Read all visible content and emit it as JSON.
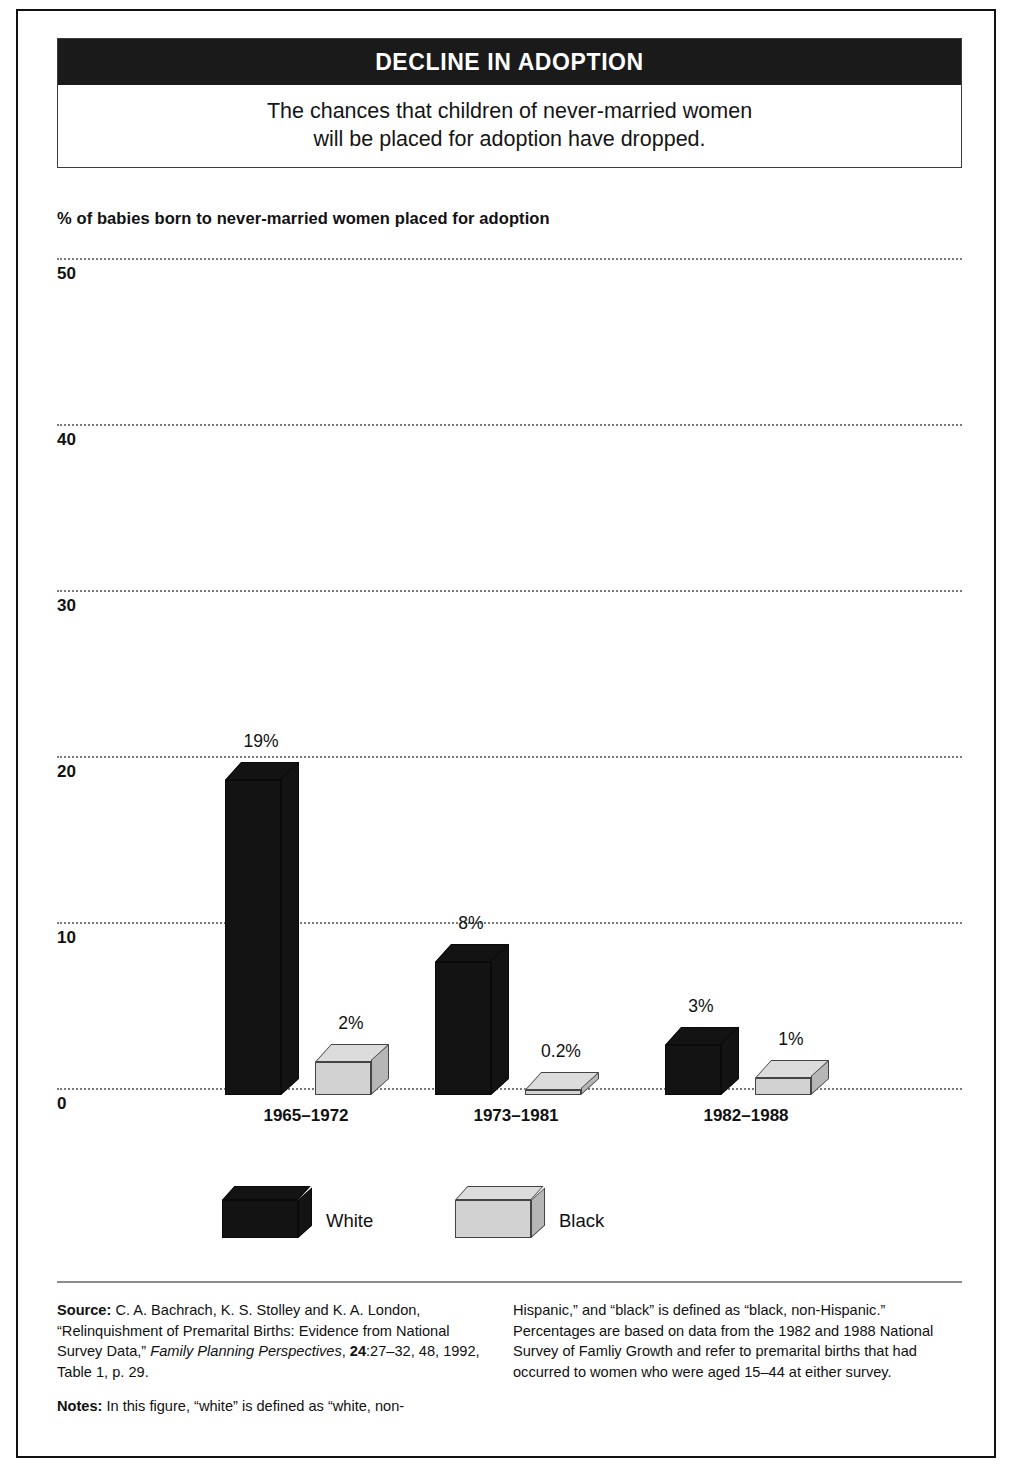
{
  "header": {
    "bar_title": "DECLINE IN ADOPTION",
    "subtitle_line1": "The chances that children of never-married women",
    "subtitle_line2": "will be placed for adoption have dropped."
  },
  "chart_data": {
    "type": "bar",
    "title": "DECLINE IN ADOPTION",
    "subtitle": "The chances that children of never-married women will be placed for adoption have dropped.",
    "ylabel": "% of babies born to never-married women placed for adoption",
    "xlabel": "",
    "categories": [
      "1965–1972",
      "1973–1981",
      "1982–1988"
    ],
    "series": [
      {
        "name": "White",
        "values": [
          19,
          8,
          3
        ],
        "labels": [
          "19%",
          "8%",
          "3%"
        ],
        "color": "#131313"
      },
      {
        "name": "Black",
        "values": [
          2,
          0.2,
          1
        ],
        "labels": [
          "2%",
          "0.2%",
          "1%"
        ],
        "color": "#d2d2d2"
      }
    ],
    "ylim": [
      0,
      50
    ],
    "yticks": [
      "0",
      "10",
      "20",
      "30",
      "40",
      "50"
    ],
    "ytick_values": [
      0,
      10,
      20,
      30,
      40,
      50
    ],
    "grid": true,
    "grid_style": "dotted-horizontal",
    "legend_position": "bottom",
    "style": "3d-blocks"
  },
  "axis": {
    "caption": "% of babies born to never-married women placed for adoption"
  },
  "legend": {
    "items": [
      {
        "label": "White",
        "color": "#131313"
      },
      {
        "label": "Black",
        "color": "#d2d2d2"
      }
    ]
  },
  "notes": {
    "source_label": "Source:",
    "source_text_1": " C. A. Bachrach, K. S. Stolley and K. A. London, “Relinquishment of Premarital Births: Evidence from National Survey Data,” ",
    "source_italic": "Family Planning Perspectives",
    "source_text_2": ", ",
    "source_bold_vol": "24",
    "source_text_3": ":27–32, 48, 1992, Table 1, p. 29.",
    "notes_label": "Notes:",
    "notes_text_left": " In this figure, “white” is defined as “white, non-",
    "notes_text_right": "Hispanic,” and “black” is defined as “black, non-Hispanic.” Percentages are based on data from the 1982 and 1988 National Survey of Famliy Growth and refer to premarital births that had occurred to women who were aged 15–44 at either survey."
  }
}
